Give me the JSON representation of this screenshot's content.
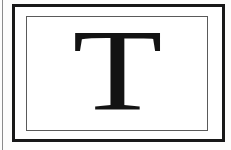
{
  "figure": {
    "letter": "T"
  },
  "colors": {
    "background": "#fdfdfc",
    "frame_outer": "#181818",
    "frame_inner": "#5a5a5a",
    "letter": "#131313",
    "page_edge_line": "#8b8b8b"
  }
}
